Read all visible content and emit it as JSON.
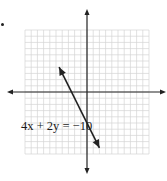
{
  "chart_data": {
    "type": "line",
    "title": "",
    "xlabel": "",
    "ylabel": "",
    "grid": true,
    "xlim": [
      -10,
      10
    ],
    "ylim": [
      -10,
      10
    ],
    "axis_color": "#222222",
    "grid_color": "#d4d4d4",
    "line_color": "#222222",
    "series": [
      {
        "name": "4x + 2y = -10",
        "equation": "y = -2x - 5",
        "slope": -2,
        "y_intercept": -5,
        "x": [
          -4.5,
          2
        ],
        "y": [
          4,
          -9
        ],
        "arrows_both_ends": true
      }
    ],
    "annotations": [
      {
        "text": "4x + 2y = −10",
        "near": [
          -6.5,
          -5
        ]
      }
    ]
  },
  "label": {
    "equation": "4x + 2y = −10"
  }
}
